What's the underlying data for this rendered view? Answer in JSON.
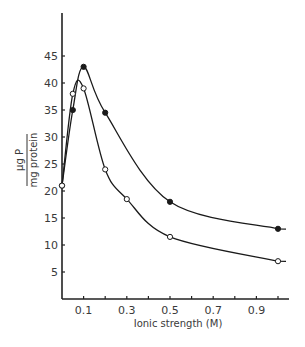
{
  "chart_data": {
    "type": "line",
    "title": "",
    "xlabel": "Ionic strength (M)",
    "ylabel": {
      "numerator": "µg P",
      "denominator": "mg protein"
    },
    "xlim": [
      0,
      1.05
    ],
    "ylim": [
      0,
      50
    ],
    "x_ticks": [
      0.1,
      0.2,
      0.3,
      0.4,
      0.5,
      0.6,
      0.7,
      0.8,
      0.9,
      1.0
    ],
    "x_tick_labels": [
      {
        "value": 0.1,
        "label": "0.1"
      },
      {
        "value": 0.3,
        "label": "0.3"
      },
      {
        "value": 0.5,
        "label": "0.5"
      },
      {
        "value": 0.7,
        "label": "0.7"
      },
      {
        "value": 0.9,
        "label": "0.9"
      }
    ],
    "y_ticks": [
      5,
      10,
      15,
      20,
      25,
      30,
      35,
      40,
      45
    ],
    "y_tick_labels": [
      "5",
      "10",
      "15",
      "20",
      "25",
      "30",
      "35",
      "40",
      "45"
    ],
    "grid": false,
    "legend": null,
    "series": [
      {
        "name": "filled circles",
        "marker": "filled-circle",
        "color": "#1a1a1a",
        "x": [
          0.0,
          0.05,
          0.1,
          0.2,
          0.5,
          1.0
        ],
        "y": [
          21,
          35,
          43,
          34.5,
          18,
          13
        ]
      },
      {
        "name": "open circles",
        "marker": "open-circle",
        "color": "#1a1a1a",
        "x": [
          0.0,
          0.05,
          0.1,
          0.2,
          0.3,
          0.5,
          1.0
        ],
        "y": [
          21,
          38,
          39,
          24,
          18.5,
          11.5,
          7
        ]
      }
    ]
  }
}
